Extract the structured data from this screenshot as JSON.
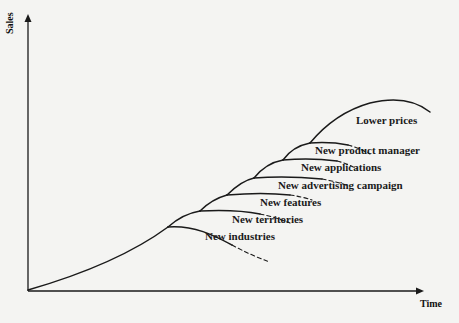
{
  "diagram": {
    "type": "product-life-cycle extension",
    "axes": {
      "y_label": "Sales",
      "x_label": "Time"
    },
    "extensions": [
      {
        "label": "New industries"
      },
      {
        "label": "New territories"
      },
      {
        "label": "New features"
      },
      {
        "label": "New advertising campaign"
      },
      {
        "label": "New applications"
      },
      {
        "label": "New product manager"
      },
      {
        "label": "Lower prices"
      }
    ],
    "colors": {
      "line": "#1a1a1a",
      "background": "#f4f4f2"
    }
  }
}
